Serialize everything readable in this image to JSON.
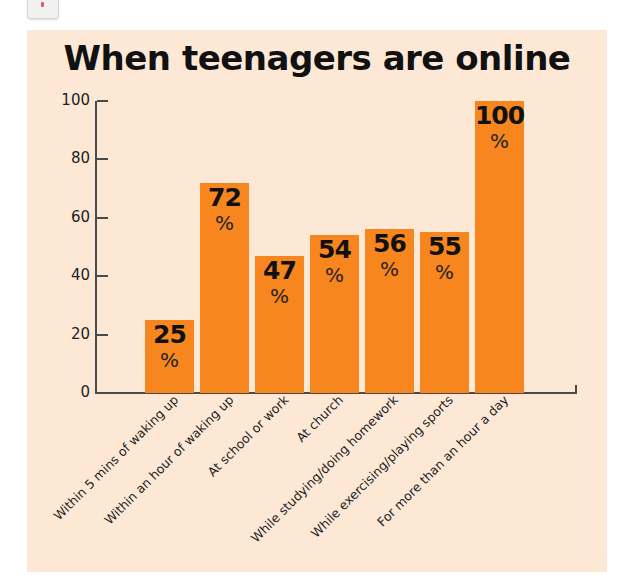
{
  "corner_icon": "note-icon",
  "colors": {
    "panel_background": "#fde8d6",
    "bar": "#f7861f",
    "axis": "#4a4a4a",
    "text": "#111111"
  },
  "chart_data": {
    "type": "bar",
    "title": "When teenagers are online",
    "xlabel": "",
    "ylabel": "",
    "ylim": [
      0,
      100
    ],
    "yticks": [
      0,
      20,
      40,
      60,
      80,
      100
    ],
    "grid": false,
    "legend": null,
    "categories": [
      "Within 5 mins of waking up",
      "Within an hour of waking up",
      "At school or work",
      "At church",
      "While studying/doing homework",
      "While exercising/playing sports",
      "For more than an hour a day"
    ],
    "values": [
      25,
      72,
      47,
      54,
      56,
      55,
      100
    ],
    "value_unit": "%",
    "data_labels": [
      "25",
      "72",
      "47",
      "54",
      "56",
      "55",
      "100"
    ]
  }
}
